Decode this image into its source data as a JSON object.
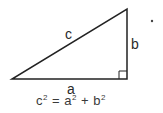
{
  "diagram": {
    "type": "right-triangle",
    "labels": {
      "hypotenuse": "c",
      "vertical_leg": "b",
      "horizontal_leg": "a"
    },
    "formula": {
      "lhs": "c",
      "lhs_exp": "2",
      "equals": "=",
      "term1": "a",
      "term1_exp": "2",
      "plus": "+",
      "term2": "b",
      "term2_exp": "2"
    },
    "colors": {
      "stroke": "#222222",
      "text": "#2a2a2a"
    }
  }
}
